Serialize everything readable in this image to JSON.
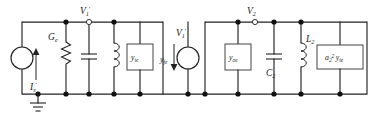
{
  "figure": {
    "name": "small-signal-equivalent-circuit",
    "type": "schematic",
    "background_color": "#ffffff",
    "line_color": "#222222"
  },
  "nodes": {
    "v1_prime": "V",
    "v1_prime_sub": "1",
    "v1_prime_sup": "'",
    "v2": "V",
    "v2_sub": "2"
  },
  "sources": {
    "input_current": {
      "symbol": "I",
      "sub": "s",
      "sup": "'",
      "direction": "up"
    },
    "transfer_current": {
      "symbol": "y",
      "sub": "fe",
      "direction": "down",
      "control_label": "V",
      "control_sub": "1",
      "control_sup": "'"
    }
  },
  "components": {
    "conductance": {
      "symbol": "G",
      "sub": "e"
    },
    "cap_left": {
      "symbol": "",
      "sub": ""
    },
    "ind_left": {
      "symbol": "",
      "sub": ""
    },
    "y_ie_box": {
      "symbol": "y",
      "sub": "ie"
    },
    "y_oe_box": {
      "symbol": "y",
      "sub": "oe"
    },
    "cap_c2": {
      "symbol": "C",
      "sub": "2"
    },
    "ind_l2": {
      "symbol": "L",
      "sub": "2"
    },
    "a2_yie_box": {
      "symbol": "a",
      "sub": "2",
      "sup": "2",
      "symbol2": "y",
      "sub2": "ie"
    }
  },
  "ground": {
    "label": "",
    "present": true
  }
}
